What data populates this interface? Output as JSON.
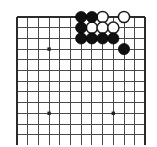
{
  "figure": {
    "kind": "go-board-diagram"
  },
  "board": {
    "visible_columns": 13,
    "visible_rows": 12,
    "cell_size": 10.7,
    "origin_x": 17,
    "origin_y": 17,
    "line_color": "#4a4a4a",
    "edge_color": "#2b2b2b",
    "background_color": "#ffffff",
    "edges": {
      "top": true,
      "left": true,
      "right": true,
      "bottom": false
    }
  },
  "star_points": [
    {
      "col": 3,
      "row": 3
    },
    {
      "col": 3,
      "row": 9
    },
    {
      "col": 9,
      "row": 9
    }
  ],
  "stones": {
    "black_color": "#101010",
    "white_color": "#fdfdfd",
    "radius": 5.6,
    "black": [
      {
        "col": 6,
        "row": 0
      },
      {
        "col": 7,
        "row": 0
      },
      {
        "col": 6,
        "row": 1
      },
      {
        "col": 6,
        "row": 2
      },
      {
        "col": 7,
        "row": 2
      },
      {
        "col": 8,
        "row": 2
      },
      {
        "col": 9,
        "row": 2
      },
      {
        "col": 10,
        "row": 3
      }
    ],
    "white": [
      {
        "col": 8,
        "row": 0
      },
      {
        "col": 10,
        "row": 0
      },
      {
        "col": 7,
        "row": 1
      },
      {
        "col": 8,
        "row": 1
      },
      {
        "col": 9,
        "row": 1
      }
    ]
  },
  "counts": {
    "black_stones": 8,
    "white_stones": 5
  }
}
